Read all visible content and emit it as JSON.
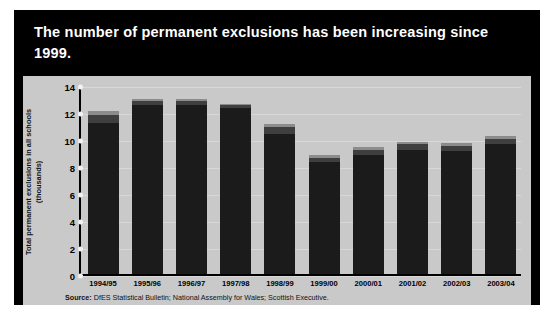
{
  "title": "The number of permanent exclusions has been increasing since 1999.",
  "source_prefix": "Source:",
  "source_text": "DfES Statistical Bulletin; National Assembly for Wales; Scottish Executive.",
  "colors": {
    "panel_background": "#000000",
    "plot_background": "#c9c9c9",
    "england": "#1b1b1b",
    "scotland": "#3f3f3f",
    "wales": "#8c8c8c",
    "title_text": "#ffffff"
  },
  "legend": {
    "position": "top-right",
    "items": [
      {
        "label": "England",
        "color": "#1b1b1b"
      },
      {
        "label": "Scotland",
        "color": "#3f3f3f"
      },
      {
        "label": "Wales",
        "color": "#9a9a9a"
      }
    ]
  },
  "chart_data": {
    "type": "bar",
    "stacked": true,
    "title": "The number of permanent exclusions has been increasing since 1999.",
    "xlabel": "",
    "ylabel": "Total permanent exclusions in all schools (thousands)",
    "ylim": [
      0,
      14
    ],
    "yticks": [
      0,
      2,
      4,
      6,
      8,
      10,
      12,
      14
    ],
    "ytick_labels": [
      "0",
      "2",
      "4",
      "6",
      "8",
      "10",
      "12",
      "14"
    ],
    "grid": true,
    "legend_position": "upper right",
    "categories": [
      "1994/95",
      "1995/96",
      "1996/97",
      "1997/98",
      "1998/99",
      "1999/00",
      "2000/01",
      "2001/02",
      "2002/03",
      "2003/04"
    ],
    "series": [
      {
        "name": "England",
        "color": "#1b1b1b",
        "values": [
          11.2,
          12.5,
          12.5,
          12.3,
          10.4,
          8.3,
          8.8,
          9.2,
          9.1,
          9.6
        ]
      },
      {
        "name": "Scotland",
        "color": "#3f3f3f",
        "values": [
          0.6,
          0.3,
          0.3,
          0.2,
          0.5,
          0.3,
          0.4,
          0.4,
          0.4,
          0.4
        ]
      },
      {
        "name": "Wales",
        "color": "#8c8c8c",
        "values": [
          0.3,
          0.2,
          0.2,
          0.1,
          0.2,
          0.2,
          0.2,
          0.2,
          0.2,
          0.2
        ]
      }
    ],
    "totals": [
      12.1,
      13.0,
      13.0,
      12.6,
      11.1,
      8.8,
      9.4,
      9.8,
      9.7,
      10.2
    ]
  }
}
